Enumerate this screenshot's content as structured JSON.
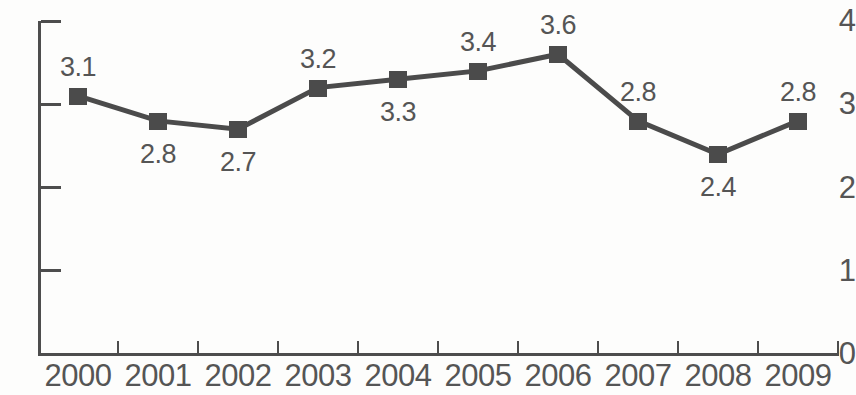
{
  "chart_data": {
    "type": "line",
    "title": "",
    "subtitle": "",
    "xlabel": "",
    "ylabel": "",
    "categories": [
      "2000",
      "2001",
      "2002",
      "2003",
      "2004",
      "2005",
      "2006",
      "2007",
      "2008",
      "2009"
    ],
    "values": [
      3.1,
      2.8,
      2.7,
      3.2,
      3.3,
      3.4,
      3.6,
      2.8,
      2.4,
      2.8
    ],
    "point_labels": [
      "3.1",
      "2.8",
      "2.7",
      "3.2",
      "3.3",
      "3.4",
      "3.6",
      "2.8",
      "2.4",
      "2.8"
    ],
    "label_positions": [
      "above",
      "below",
      "below",
      "above",
      "below",
      "above",
      "above",
      "above",
      "below",
      "above"
    ],
    "ylim": [
      0,
      4
    ],
    "ytick_labels": [
      "0",
      "1",
      "2",
      "3",
      "4"
    ],
    "ytick_values": [
      0,
      1,
      2,
      3,
      4
    ],
    "grid": false,
    "legend": null,
    "series": [
      {
        "name": "",
        "values": [
          3.1,
          2.8,
          2.7,
          3.2,
          3.3,
          3.4,
          3.6,
          2.8,
          2.4,
          2.8
        ],
        "marker": "square",
        "color": "#4b4b4b"
      }
    ],
    "colors": {
      "line": "#4b4b4b",
      "marker": "#4b4b4b",
      "axis": "#4d4d4d",
      "text": "#555555",
      "background": "#fdfdfc"
    }
  }
}
